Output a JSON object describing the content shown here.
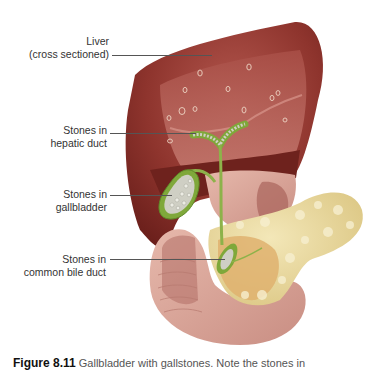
{
  "figure": {
    "labels": [
      {
        "id": "liver",
        "line1": "Liver",
        "line2": "(cross sectioned)"
      },
      {
        "id": "hepatic",
        "line1": "Stones in",
        "line2": "hepatic duct"
      },
      {
        "id": "gallbladder",
        "line1": "Stones in",
        "line2": "gallbladder"
      },
      {
        "id": "common-bile",
        "line1": "Stones in",
        "line2": "common bile duct"
      }
    ],
    "caption": {
      "number": "Figure 8.11",
      "text": "Gallbladder with gallstones. Note the stones in"
    },
    "colors": {
      "liver": "#7e2a25",
      "liver_section": "#b8635c",
      "gallbladder_wall": "#7fa83a",
      "stones": "#cfcfc4",
      "intestine": "#d9a59a",
      "pancreas": "#e8d9a0"
    }
  }
}
